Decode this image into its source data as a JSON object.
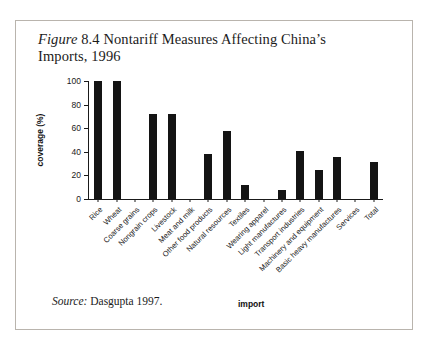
{
  "figure": {
    "label_italic": "Figure",
    "number": "8.4",
    "title_rest": "Nontariff Measures Affecting China’s Imports, 1996",
    "source_label": "Source:",
    "source_text": "Dasgupta 1997."
  },
  "chart_data": {
    "type": "bar",
    "title": "Figure 8.4 Nontariff Measures Affecting China’s Imports, 1996",
    "xlabel": "import",
    "ylabel": "coverage (%)",
    "ylim": [
      0,
      100
    ],
    "yticks": [
      0,
      20,
      40,
      60,
      80,
      100
    ],
    "grid": false,
    "legend": "none",
    "bar_color": "#141414",
    "categories": [
      "Rice",
      "Wheat",
      "Coarse grains",
      "Nongrain crops",
      "Livestock",
      "Meat and milk",
      "Other food products",
      "Natural resources",
      "Textiles",
      "Wearing apparel",
      "Light manufactures",
      "Transport industries",
      "Machinery and equipment",
      "Basic heavy manufactures",
      "Services",
      "Total"
    ],
    "values": [
      100,
      100,
      0,
      72,
      72,
      0,
      38,
      58,
      12,
      0,
      8,
      41,
      25,
      36,
      0,
      31
    ]
  }
}
